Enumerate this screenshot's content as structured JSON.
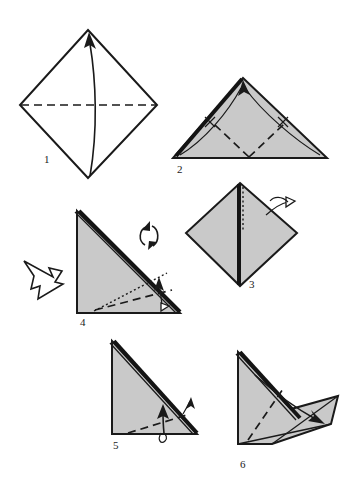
{
  "document": {
    "title": "Origami folding instructions",
    "subject": "paper folding diagram",
    "background_color": "#ffffff",
    "paper_front_color": "#ffffff",
    "paper_back_color": "#c9c9c9",
    "line_color": "#1a1a1a",
    "step_count": 6
  },
  "steps": [
    {
      "number": "1",
      "name": "square-diamond-valley-fold",
      "shape": "square rotated 45 degrees (diamond), white side up",
      "creases": [
        "horizontal dashed valley fold across the middle"
      ],
      "arrows": [
        "curved arrow from bottom vertex up to top vertex"
      ]
    },
    {
      "number": "2",
      "name": "triangle-fold-corners-to-apex",
      "shape": "gray triangle, apex at top center",
      "creases": [
        "dashed valley fold from bottom center up-left",
        "dashed valley fold from bottom center up-right"
      ],
      "arrows": [
        "curved arrow from bottom-left corner to apex",
        "curved arrow from bottom-right corner to apex"
      ]
    },
    {
      "number": "3",
      "name": "diamond-turn-over",
      "shape": "gray diamond with vertical center seam",
      "creases": [
        "vertical dotted center line"
      ],
      "arrows": [
        "small turn-over arrow looping over right edge"
      ]
    },
    {
      "number": "4",
      "name": "right-triangle-fold-and-rotate",
      "shape": "gray right triangle, right angle at bottom-left, thick layered hypotenuse",
      "creases": [
        "dashed valley fold to lower right",
        "dotted guide line"
      ],
      "arrows": [
        "small fold arrow at lower right",
        "rotation symbol (two circular arrows)",
        "large hollow turn-over arrow at left"
      ]
    },
    {
      "number": "5",
      "name": "right-triangle-fold-unfold",
      "shape": "gray right triangle, right angle at bottom-left, thick layered hypotenuse",
      "creases": [
        "dashed valley fold across lower portion"
      ],
      "arrows": [
        "fold-and-unfold arrow pointing up-right",
        "small arrow crossing the hypotenuse"
      ]
    },
    {
      "number": "6",
      "name": "shape-with-extended-point",
      "shape": "gray folded form with a pointed flap extending to the right",
      "creases": [
        "dashed fold line running down-left"
      ],
      "arrows": [
        "long arrow pointing down-right toward the flap"
      ]
    }
  ]
}
